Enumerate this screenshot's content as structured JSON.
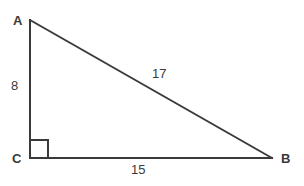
{
  "figure": {
    "kind": "right-triangle-diagram",
    "background_color": "#ffffff",
    "stroke_color": "#3a3a3a",
    "stroke_width": 2,
    "vertices": [
      {
        "name": "A",
        "label": "A",
        "x": 30,
        "y": 20
      },
      {
        "name": "C",
        "label": "C",
        "x": 30,
        "y": 158
      },
      {
        "name": "B",
        "label": "B",
        "x": 272,
        "y": 158
      }
    ],
    "sides": [
      {
        "name": "AC",
        "label": "8",
        "from": "A",
        "to": "C",
        "role": "vertical-leg"
      },
      {
        "name": "AB",
        "label": "17",
        "from": "A",
        "to": "B",
        "role": "hypotenuse"
      },
      {
        "name": "CB",
        "label": "15",
        "from": "C",
        "to": "B",
        "role": "horizontal-leg"
      }
    ],
    "right_angle": {
      "at_vertex": "C",
      "marker": "square",
      "size": 18
    }
  }
}
